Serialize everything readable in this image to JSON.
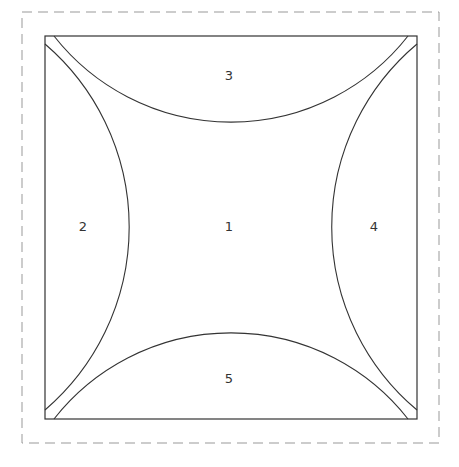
{
  "diagram": {
    "type": "region-partition",
    "colors": {
      "background": "#ffffff",
      "stroke": "#333333",
      "dashed_border": "#999999"
    },
    "regions": [
      {
        "id": "1",
        "label": "1",
        "position": "center"
      },
      {
        "id": "2",
        "label": "2",
        "position": "left"
      },
      {
        "id": "3",
        "label": "3",
        "position": "top"
      },
      {
        "id": "4",
        "label": "4",
        "position": "right"
      },
      {
        "id": "5",
        "label": "5",
        "position": "bottom"
      }
    ]
  }
}
